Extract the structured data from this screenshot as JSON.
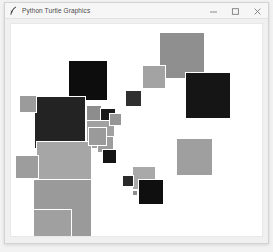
{
  "window": {
    "title": "Python Turtle Graphics",
    "icon": "python-feather-icon",
    "controls": {
      "minimize_label": "–",
      "maximize_label": "□",
      "close_label": "×",
      "minimize_name": "minimize-button",
      "maximize_name": "maximize-button",
      "close_name": "close-button"
    }
  },
  "canvas": {
    "name": "turtle-canvas",
    "background": "#ffffff",
    "width": 253,
    "height": 212,
    "palette": {
      "black": "#111111",
      "near_black": "#1c1c1c",
      "dark_gray": "#2e2e2e",
      "mid_gray": "#8f8f8f",
      "light_gray": "#a8a8a8",
      "pale_gray": "#b5b5b5",
      "outline": "#ffffff"
    },
    "shapes": [
      {
        "id": "sq-01",
        "x": 149,
        "y": 8,
        "size": 47,
        "fill": "#8f8f8f",
        "border": "#ffffff"
      },
      {
        "id": "sq-02",
        "x": 175,
        "y": 48,
        "size": 47,
        "fill": "#151515",
        "border": "#ffffff"
      },
      {
        "id": "sq-03",
        "x": 132,
        "y": 41,
        "size": 24,
        "fill": "#a3a3a3",
        "border": "#ffffff"
      },
      {
        "id": "sq-04",
        "x": 115,
        "y": 66,
        "size": 17,
        "fill": "#2f2f2f",
        "border": "#ffffff"
      },
      {
        "id": "sq-05",
        "x": 57,
        "y": 36,
        "size": 41,
        "fill": "#0d0d0d",
        "border": "#ffffff"
      },
      {
        "id": "sq-06",
        "x": 23,
        "y": 72,
        "size": 53,
        "fill": "#232323",
        "border": "#ffffff"
      },
      {
        "id": "sq-07",
        "x": 8,
        "y": 71,
        "size": 18,
        "fill": "#9b9b9b",
        "border": "#ffffff"
      },
      {
        "id": "sq-08",
        "x": 76,
        "y": 81,
        "size": 16,
        "fill": "#8d8d8d",
        "border": "#ffffff"
      },
      {
        "id": "sq-09",
        "x": 90,
        "y": 84,
        "size": 16,
        "fill": "#1a1a1a",
        "border": "#ffffff"
      },
      {
        "id": "sq-10",
        "x": 76,
        "y": 96,
        "size": 29,
        "fill": "#a1a1a1",
        "border": "#ffffff"
      },
      {
        "id": "sq-11",
        "x": 87,
        "y": 112,
        "size": 17,
        "fill": "#9d9d9d",
        "border": "#ffffff"
      },
      {
        "id": "sq-12",
        "x": 92,
        "y": 125,
        "size": 15,
        "fill": "#141414",
        "border": "#ffffff"
      },
      {
        "id": "sq-13",
        "x": 25,
        "y": 117,
        "size": 57,
        "fill": "#a6a6a6",
        "border": "#ffffff"
      },
      {
        "id": "sq-14",
        "x": 4,
        "y": 131,
        "size": 24,
        "fill": "#9d9d9d",
        "border": "#ffffff"
      },
      {
        "id": "sq-15",
        "x": 22,
        "y": 155,
        "size": 60,
        "fill": "#9a9a9a",
        "border": "#ffffff"
      },
      {
        "id": "sq-16",
        "x": 78,
        "y": 103,
        "size": 19,
        "fill": "#9a9a9a",
        "border": "#ffffff"
      },
      {
        "id": "sq-17",
        "x": 122,
        "y": 142,
        "size": 24,
        "fill": "#a9a9a9",
        "border": "#ffffff"
      },
      {
        "id": "sq-18",
        "x": 112,
        "y": 151,
        "size": 12,
        "fill": "#2a2a2a",
        "border": "#ffffff"
      },
      {
        "id": "sq-19",
        "x": 128,
        "y": 155,
        "size": 26,
        "fill": "#0f0f0f",
        "border": "#ffffff"
      },
      {
        "id": "sq-20",
        "x": 122,
        "y": 166,
        "size": 6,
        "fill": "#8d8d8d",
        "border": "#ffffff"
      },
      {
        "id": "sq-21",
        "x": 166,
        "y": 114,
        "size": 38,
        "fill": "#9f9f9f",
        "border": "#ffffff"
      },
      {
        "id": "sq-22",
        "x": 22,
        "y": 185,
        "size": 40,
        "fill": "#a0a0a0",
        "border": "#ffffff"
      },
      {
        "id": "sq-23",
        "x": 99,
        "y": 89,
        "size": 13,
        "fill": "#969696",
        "border": "#ffffff"
      }
    ]
  }
}
